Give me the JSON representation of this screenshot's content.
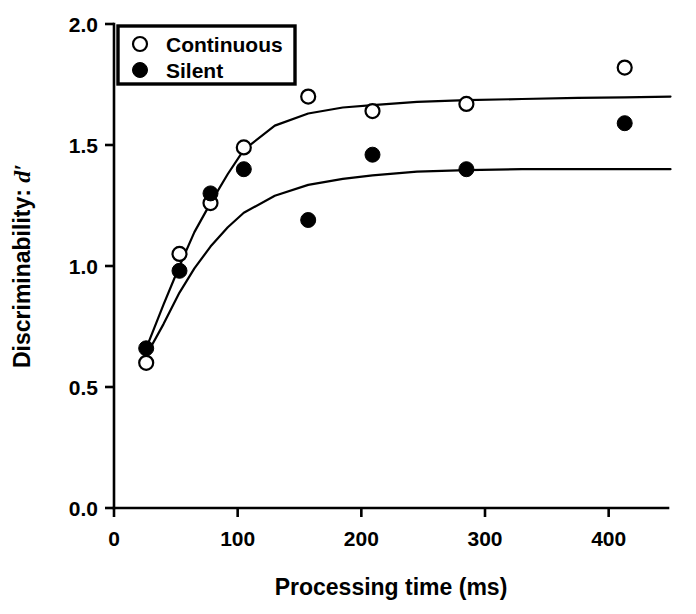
{
  "chart_data": {
    "type": "scatter",
    "title": "",
    "xlabel": "Processing time (ms)",
    "ylabel": "Discriminability: d′",
    "ylabel_prefix": "Discriminability: ",
    "ylabel_symbol": "d′",
    "xlim": [
      0,
      450
    ],
    "ylim": [
      0.0,
      2.0
    ],
    "xticks": [
      0,
      100,
      200,
      300,
      400
    ],
    "xtick_labels": [
      "0",
      "100",
      "200",
      "300",
      "400"
    ],
    "yticks": [
      0.0,
      0.5,
      1.0,
      1.5,
      2.0
    ],
    "ytick_labels": [
      "0.0",
      "0.5",
      "1.0",
      "1.5",
      "2.0"
    ],
    "grid": false,
    "legend_position": "top-left",
    "series": [
      {
        "name": "Continuous",
        "marker": "open-circle",
        "color": "#000000",
        "x": [
          26,
          53,
          78,
          105,
          157,
          209,
          285,
          413
        ],
        "values": [
          0.6,
          1.05,
          1.26,
          1.49,
          1.7,
          1.64,
          1.67,
          1.82
        ],
        "fit_curve": {
          "x": [
            26,
            40,
            53,
            65,
            78,
            92,
            105,
            130,
            157,
            185,
            209,
            245,
            285,
            330,
            375,
            413,
            450
          ],
          "y": [
            0.66,
            0.84,
            1.0,
            1.14,
            1.26,
            1.38,
            1.48,
            1.58,
            1.63,
            1.655,
            1.665,
            1.678,
            1.685,
            1.69,
            1.695,
            1.697,
            1.7
          ]
        }
      },
      {
        "name": "Silent",
        "marker": "filled-circle",
        "color": "#000000",
        "x": [
          26,
          53,
          78,
          105,
          157,
          209,
          285,
          413
        ],
        "values": [
          0.66,
          0.98,
          1.3,
          1.4,
          1.19,
          1.46,
          1.4,
          1.59
        ],
        "fit_curve": {
          "x": [
            26,
            40,
            53,
            65,
            78,
            92,
            105,
            130,
            157,
            185,
            209,
            245,
            285,
            330,
            375,
            413,
            450
          ],
          "y": [
            0.63,
            0.76,
            0.89,
            0.99,
            1.08,
            1.16,
            1.22,
            1.29,
            1.335,
            1.36,
            1.375,
            1.39,
            1.396,
            1.4,
            1.4,
            1.4,
            1.4
          ]
        }
      }
    ]
  },
  "legend": {
    "entries": [
      {
        "label": "Continuous",
        "marker": "open-circle"
      },
      {
        "label": "Silent",
        "marker": "filled-circle"
      }
    ]
  }
}
